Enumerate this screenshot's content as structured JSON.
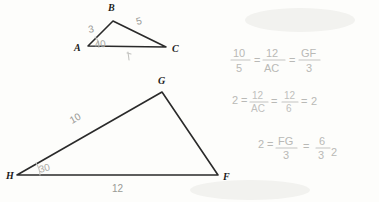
{
  "page": {
    "kind": "handwritten-geometry-worksheet-scan",
    "background_color": "#fdfdfb",
    "ink_color": "#2a2a2a",
    "pencil_color": "#b9b9b6"
  },
  "figures": [
    {
      "id": "triangle-abc",
      "name": "triangle-abc",
      "vertices": [
        {
          "label": "A",
          "x": 88,
          "y": 46,
          "label_x": 74,
          "label_y": 51
        },
        {
          "label": "B",
          "x": 113,
          "y": 21,
          "label_x": 108,
          "label_y": 11
        },
        {
          "label": "C",
          "x": 166,
          "y": 47,
          "label_x": 172,
          "label_y": 52
        }
      ],
      "side_labels": [
        {
          "text": "3",
          "x": 89,
          "y": 33
        },
        {
          "text": "5",
          "x": 137,
          "y": 25
        }
      ],
      "angle_labels": [
        {
          "text": "40",
          "x": 95,
          "y": 48,
          "at_vertex": "A"
        }
      ]
    },
    {
      "id": "triangle-hgf",
      "name": "triangle-hgf",
      "vertices": [
        {
          "label": "H",
          "x": 17,
          "y": 175,
          "label_x": 6,
          "label_y": 179
        },
        {
          "label": "G",
          "x": 162,
          "y": 92,
          "label_x": 158,
          "label_y": 84
        },
        {
          "label": "F",
          "x": 218,
          "y": 175,
          "label_x": 223,
          "label_y": 180
        }
      ],
      "side_labels": [
        {
          "text": "10",
          "x": 72,
          "y": 124
        },
        {
          "text": "12",
          "x": 112,
          "y": 192
        }
      ],
      "angle_labels": [
        {
          "text": "30",
          "x": 40,
          "y": 173,
          "at_vertex": "H"
        }
      ]
    }
  ],
  "work": {
    "lines": [
      {
        "id": "work-line-1",
        "text": "10/5 = 12/AC = GF/3",
        "terms": [
          {
            "type": "fraction",
            "num": "10",
            "den": "5"
          },
          {
            "type": "op",
            "text": "="
          },
          {
            "type": "fraction",
            "num": "12",
            "den": "AC"
          },
          {
            "type": "op",
            "text": "="
          },
          {
            "type": "fraction",
            "num": "GF",
            "den": "3"
          }
        ]
      },
      {
        "id": "work-line-2",
        "text": "2 = 12/AC = 12/6 = 2",
        "terms": [
          {
            "type": "whole",
            "text": "2"
          },
          {
            "type": "op",
            "text": "="
          },
          {
            "type": "fraction",
            "num": "12",
            "den": "AC"
          },
          {
            "type": "op",
            "text": "="
          },
          {
            "type": "fraction",
            "num": "12",
            "den": "6"
          },
          {
            "type": "op",
            "text": "="
          },
          {
            "type": "whole",
            "text": "2"
          }
        ]
      },
      {
        "id": "work-line-3",
        "text": "2 = FG/3 = 6/3 = 2",
        "terms": [
          {
            "type": "whole",
            "text": "2"
          },
          {
            "type": "op",
            "text": "="
          },
          {
            "type": "fraction",
            "num": "FG",
            "den": "3"
          },
          {
            "type": "op",
            "text": "="
          },
          {
            "type": "fraction",
            "num": "6",
            "den": "3"
          },
          {
            "type": "op",
            "text": "="
          },
          {
            "type": "whole",
            "text": "2"
          }
        ]
      }
    ]
  }
}
